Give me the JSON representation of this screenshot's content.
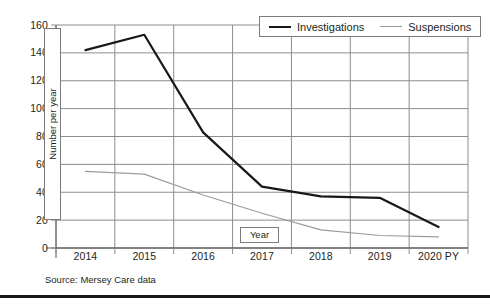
{
  "figure": {
    "source_note": "Source: Mersey Care data",
    "background_color": "#ffffff",
    "rule_color": "#16191c"
  },
  "legend": {
    "position": "top-right",
    "entries": [
      {
        "label": "Investigations",
        "swatch": "line-swatch-investigations",
        "color": "#16191c"
      },
      {
        "label": "Suspensions",
        "swatch": "line-swatch-suspensions",
        "color": "#9b9b9b"
      }
    ]
  },
  "chart_data": {
    "type": "line",
    "title": "",
    "subtitle": "",
    "xlabel": "Year",
    "ylabel": "Number per year",
    "categories": [
      "2014",
      "2015",
      "2016",
      "2017",
      "2018",
      "2019",
      "2020 PY"
    ],
    "x_tick_labels": [
      "2014",
      "2015",
      "2016",
      "2017",
      "2018",
      "2019",
      "2020 PY"
    ],
    "y_tick_labels": [
      "0",
      "20",
      "40",
      "60",
      "80",
      "100",
      "120",
      "140",
      "160"
    ],
    "y_ticks": [
      0,
      20,
      40,
      60,
      80,
      100,
      120,
      140,
      160
    ],
    "ylim": [
      0,
      160
    ],
    "grid": "horizontal-and-vertical",
    "legend_position": "top-right",
    "series": [
      {
        "name": "Investigations",
        "color": "#16191c",
        "width": 2.2,
        "values": [
          142,
          153,
          83,
          44,
          37,
          36,
          15
        ]
      },
      {
        "name": "Suspensions",
        "color": "#9b9b9b",
        "width": 1.1,
        "values": [
          55,
          53,
          38,
          25,
          13,
          9,
          8
        ]
      }
    ]
  },
  "axes": {
    "y_title": "Number per year",
    "x_title": "Year"
  }
}
